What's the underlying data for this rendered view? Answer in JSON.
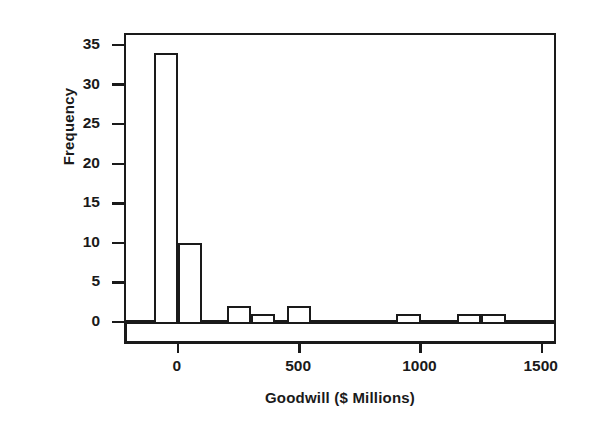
{
  "chart_data": {
    "type": "bar",
    "title": "",
    "subtitle": "",
    "xlabel": "Goodwill ($ Millions)",
    "ylabel": "Frequency",
    "xlim": [
      -200,
      1500
    ],
    "ylim": [
      0,
      35
    ],
    "grid": false,
    "legend": null,
    "bin_width": 100,
    "xticks": [
      0,
      500,
      1000,
      1500
    ],
    "xtick_labels": [
      "0",
      "500",
      "1000",
      "1500"
    ],
    "yticks": [
      0,
      5,
      10,
      15,
      20,
      25,
      30,
      35
    ],
    "ytick_labels": [
      "0",
      "5",
      "10",
      "15",
      "20",
      "25",
      "30",
      "35"
    ],
    "bins": [
      {
        "left": -100,
        "right": 0,
        "value": 34
      },
      {
        "left": 0,
        "right": 100,
        "value": 10
      },
      {
        "left": 100,
        "right": 200,
        "value": 0
      },
      {
        "left": 200,
        "right": 300,
        "value": 2
      },
      {
        "left": 300,
        "right": 400,
        "value": 1
      },
      {
        "left": 400,
        "right": 450,
        "value": 0
      },
      {
        "left": 450,
        "right": 550,
        "value": 2
      },
      {
        "left": 550,
        "right": 900,
        "value": 0
      },
      {
        "left": 900,
        "right": 1000,
        "value": 1
      },
      {
        "left": 1000,
        "right": 1150,
        "value": 0
      },
      {
        "left": 1150,
        "right": 1250,
        "value": 1
      },
      {
        "left": 1250,
        "right": 1350,
        "value": 1
      }
    ],
    "categories": [
      "-100",
      "0",
      "100",
      "200",
      "300",
      "400",
      "450",
      "550",
      "900",
      "1000",
      "1150",
      "1250"
    ],
    "values": [
      34,
      10,
      0,
      2,
      1,
      0,
      2,
      0,
      1,
      0,
      1,
      1
    ],
    "colors": {
      "bar_edge": "#1a1a1a",
      "bar_fill": "#ffffff",
      "axis": "#1a1a1a",
      "background": "#ffffff"
    }
  }
}
